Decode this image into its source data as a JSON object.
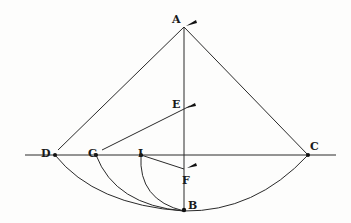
{
  "diagram": {
    "type": "geometric-construction",
    "points": {
      "A": {
        "label": "A",
        "x": 184,
        "y": 27,
        "lx": 170,
        "ly": 22
      },
      "B": {
        "label": "B",
        "x": 184,
        "y": 210,
        "lx": 187,
        "ly": 208
      },
      "C": {
        "label": "C",
        "x": 308,
        "y": 155,
        "lx": 309,
        "ly": 150
      },
      "D": {
        "label": "D",
        "x": 55,
        "y": 155,
        "lx": 41,
        "ly": 158
      },
      "E": {
        "label": "E",
        "x": 184,
        "y": 109,
        "lx": 171,
        "ly": 107
      },
      "F": {
        "label": "F",
        "x": 184,
        "y": 170,
        "lx": 181,
        "ly": 183
      },
      "G": {
        "label": "G",
        "x": 96,
        "y": 155,
        "lx": 87,
        "ly": 158
      },
      "I": {
        "label": "I",
        "x": 141,
        "y": 155,
        "lx": 138,
        "ly": 156
      }
    },
    "segments": [
      {
        "from": "A",
        "to": "B",
        "name": "vertical-axis"
      },
      {
        "from": "D",
        "to": "C",
        "name": "horizontal-axis",
        "extended": true
      },
      {
        "from": "A",
        "to": "D",
        "name": "line-AD"
      },
      {
        "from": "A",
        "to": "C",
        "name": "line-AC"
      },
      {
        "from": "G",
        "to": "E",
        "name": "line-GE"
      },
      {
        "from": "I",
        "to": "F",
        "name": "line-IF"
      }
    ],
    "arcs": [
      {
        "from": "D",
        "to": "C",
        "through": "B",
        "name": "arc-DBC"
      },
      {
        "from": "G",
        "to": "B",
        "name": "arc-GB"
      },
      {
        "from": "I",
        "to": "B",
        "name": "arc-IB"
      }
    ],
    "arrow_marks": [
      "A",
      "E",
      "F"
    ]
  }
}
